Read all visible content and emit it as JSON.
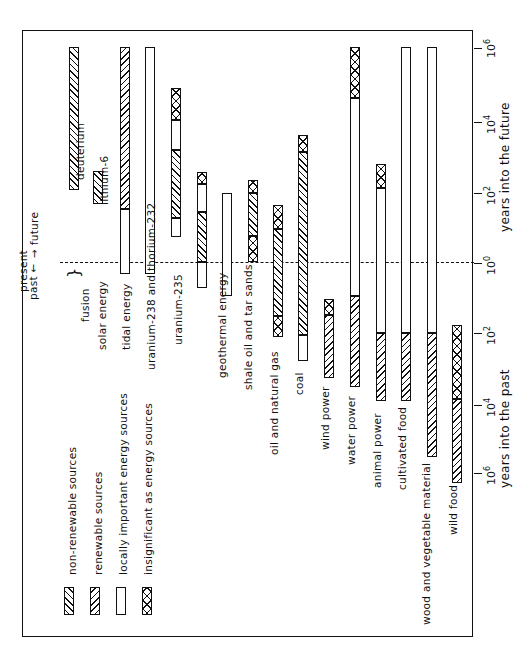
{
  "chart_data": {
    "type": "bar",
    "orientation": "rotated-90-ccw (time axis vertical, categories left-to-right)",
    "title": "",
    "axis": {
      "scale": "log10 years, signed (future positive, past negative)",
      "future_label": "years into the future",
      "past_label": "years into the past",
      "ticks": [
        {
          "value": 6,
          "label": "10",
          "exp": "6"
        },
        {
          "value": 4,
          "label": "10",
          "exp": "4"
        },
        {
          "value": 2,
          "label": "10",
          "exp": "2"
        },
        {
          "value": 0,
          "label": "10",
          "exp": "0"
        },
        {
          "value": -2,
          "label": "10",
          "exp": "2"
        },
        {
          "value": -4,
          "label": "10",
          "exp": "4"
        },
        {
          "value": -6,
          "label": "10",
          "exp": "6"
        }
      ],
      "range": [
        -6,
        6
      ]
    },
    "annotations": {
      "present": "present",
      "past": "past",
      "future": "future",
      "fusion": "fusion"
    },
    "legend": [
      {
        "key": "nonrenewable",
        "label": "non-renewable sources"
      },
      {
        "key": "renewable",
        "label": "renewable sources"
      },
      {
        "key": "local",
        "label": "locally important energy sources"
      },
      {
        "key": "insignificant",
        "label": "insignificant as energy sources"
      }
    ],
    "categories": [
      "deuterium",
      "lithium-6",
      "solar energy",
      "tidal energy",
      "uranium-238 and thorium-232",
      "uranium-235",
      "geothermal energy",
      "shale oil and tar sands",
      "oil and natural gas",
      "coal",
      "wind power",
      "water power",
      "animal power",
      "cultivated food",
      "wood and vegetable material",
      "wild food"
    ],
    "series": [
      {
        "name": "deuterium",
        "segments": [
          {
            "type": "nonrenewable",
            "from": 2.1,
            "to": 6
          }
        ]
      },
      {
        "name": "lithium-6",
        "segments": [
          {
            "type": "nonrenewable",
            "from": 1.6,
            "to": 2.6
          }
        ]
      },
      {
        "name": "solar energy",
        "segments": [
          {
            "type": "local",
            "from": -0.3,
            "to": 1.5
          },
          {
            "type": "renewable",
            "from": 1.5,
            "to": 6
          }
        ]
      },
      {
        "name": "tidal energy",
        "segments": [
          {
            "type": "local",
            "from": -0.3,
            "to": 6
          }
        ]
      },
      {
        "name": "uranium-238 and thorium-232",
        "segments": [
          {
            "type": "local",
            "from": 0.8,
            "to": 1.3
          },
          {
            "type": "nonrenewable",
            "from": 1.3,
            "to": 3.2
          },
          {
            "type": "local",
            "from": 3.2,
            "to": 4.1
          },
          {
            "type": "insignificant",
            "from": 4.1,
            "to": 5
          }
        ]
      },
      {
        "name": "uranium-235",
        "segments": [
          {
            "type": "local",
            "from": -0.7,
            "to": 0
          },
          {
            "type": "nonrenewable",
            "from": 0,
            "to": 1.4
          },
          {
            "type": "local",
            "from": 1.4,
            "to": 2.3
          },
          {
            "type": "insignificant",
            "from": 2.3,
            "to": 2.6
          }
        ]
      },
      {
        "name": "geothermal energy",
        "segments": [
          {
            "type": "local",
            "from": -0.9,
            "to": 2
          }
        ]
      },
      {
        "name": "shale oil and tar sands",
        "segments": [
          {
            "type": "insignificant",
            "from": 0,
            "to": 0.8
          },
          {
            "type": "nonrenewable",
            "from": 0.8,
            "to": 2
          },
          {
            "type": "insignificant",
            "from": 2,
            "to": 2.4
          }
        ]
      },
      {
        "name": "oil and natural gas",
        "segments": [
          {
            "type": "insignificant",
            "from": -2.1,
            "to": -1.5
          },
          {
            "type": "nonrenewable",
            "from": -1.5,
            "to": 1
          },
          {
            "type": "insignificant",
            "from": 1,
            "to": 1.6
          }
        ]
      },
      {
        "name": "coal",
        "segments": [
          {
            "type": "local",
            "from": -2.7,
            "to": -2
          },
          {
            "type": "nonrenewable",
            "from": -2,
            "to": 3.1
          },
          {
            "type": "insignificant",
            "from": 3.1,
            "to": 3.6
          }
        ]
      },
      {
        "name": "wind power",
        "segments": [
          {
            "type": "renewable",
            "from": -3.2,
            "to": -1.5
          },
          {
            "type": "insignificant",
            "from": -1.5,
            "to": -1
          }
        ]
      },
      {
        "name": "water power",
        "segments": [
          {
            "type": "renewable",
            "from": -3.5,
            "to": -0.9
          },
          {
            "type": "local",
            "from": -0.9,
            "to": 4.7
          },
          {
            "type": "insignificant",
            "from": 4.7,
            "to": 6
          }
        ]
      },
      {
        "name": "animal power",
        "segments": [
          {
            "type": "renewable",
            "from": -3.9,
            "to": -2
          },
          {
            "type": "local",
            "from": -2,
            "to": 2.1
          },
          {
            "type": "insignificant",
            "from": 2.1,
            "to": 2.8
          }
        ]
      },
      {
        "name": "cultivated food",
        "segments": [
          {
            "type": "renewable",
            "from": -3.9,
            "to": -2
          },
          {
            "type": "local",
            "from": -2,
            "to": 6
          }
        ]
      },
      {
        "name": "wood and vegetable material",
        "segments": [
          {
            "type": "renewable",
            "from": -5.4,
            "to": -2
          },
          {
            "type": "local",
            "from": -2,
            "to": 6
          }
        ]
      },
      {
        "name": "wild food",
        "segments": [
          {
            "type": "renewable",
            "from": -6.2,
            "to": -3.8
          },
          {
            "type": "insignificant",
            "from": -3.8,
            "to": -1.8
          }
        ]
      }
    ]
  },
  "layout": {
    "bars": [
      {
        "label": "deuterium",
        "x": 69,
        "lx": 82,
        "ly": 180,
        "segs": [
          {
            "t": "nonrenewable",
            "y1": 47,
            "y2": 190
          }
        ]
      },
      {
        "label": "lithium-6",
        "x": 93,
        "lx": 106,
        "ly": 205,
        "segs": [
          {
            "t": "nonrenewable",
            "y1": 171,
            "y2": 204
          }
        ]
      },
      {
        "label": "solar energy",
        "x": 120,
        "lx": 104,
        "ly": 350,
        "segs": [
          {
            "t": "renewable",
            "y1": 47,
            "y2": 209
          },
          {
            "t": "local",
            "y1": 209,
            "y2": 274
          }
        ]
      },
      {
        "label": "tidal energy",
        "x": 145,
        "lx": 128,
        "ly": 350,
        "segs": [
          {
            "t": "local",
            "y1": 47,
            "y2": 274
          }
        ]
      },
      {
        "label": "uranium-238 and thorium-232",
        "x": 171,
        "lx": 153,
        "ly": 370,
        "segs": [
          {
            "t": "insignificant",
            "y1": 88,
            "y2": 120
          },
          {
            "t": "local",
            "y1": 120,
            "y2": 150
          },
          {
            "t": "nonrenewable",
            "y1": 150,
            "y2": 218
          },
          {
            "t": "local",
            "y1": 218,
            "y2": 237
          }
        ]
      },
      {
        "label": "uranium-235",
        "x": 197,
        "lx": 180,
        "ly": 345,
        "segs": [
          {
            "t": "insignificant",
            "y1": 172,
            "y2": 184
          },
          {
            "t": "local",
            "y1": 184,
            "y2": 212
          },
          {
            "t": "nonrenewable",
            "y1": 212,
            "y2": 262
          },
          {
            "t": "local",
            "y1": 262,
            "y2": 288
          }
        ]
      },
      {
        "label": "geothermal energy",
        "x": 222,
        "lx": 224,
        "ly": 378,
        "segs": [
          {
            "t": "local",
            "y1": 193,
            "y2": 296
          }
        ]
      },
      {
        "label": "shale oil and tar sands",
        "x": 248,
        "lx": 250,
        "ly": 390,
        "segs": [
          {
            "t": "insignificant",
            "y1": 180,
            "y2": 193
          },
          {
            "t": "nonrenewable",
            "y1": 193,
            "y2": 236
          },
          {
            "t": "insignificant",
            "y1": 236,
            "y2": 262
          }
        ]
      },
      {
        "label": "oil and natural gas",
        "x": 273,
        "lx": 276,
        "ly": 455,
        "segs": [
          {
            "t": "insignificant",
            "y1": 205,
            "y2": 229
          },
          {
            "t": "nonrenewable",
            "y1": 229,
            "y2": 316
          },
          {
            "t": "insignificant",
            "y1": 316,
            "y2": 337
          }
        ]
      },
      {
        "label": "coal",
        "x": 298,
        "lx": 301,
        "ly": 395,
        "segs": [
          {
            "t": "insignificant",
            "y1": 135,
            "y2": 152
          },
          {
            "t": "nonrenewable",
            "y1": 152,
            "y2": 335
          },
          {
            "t": "local",
            "y1": 335,
            "y2": 361
          }
        ]
      },
      {
        "label": "wind power",
        "x": 324,
        "lx": 327,
        "ly": 450,
        "segs": [
          {
            "t": "insignificant",
            "y1": 299,
            "y2": 315
          },
          {
            "t": "renewable",
            "y1": 315,
            "y2": 378
          }
        ]
      },
      {
        "label": "water power",
        "x": 350,
        "lx": 353,
        "ly": 465,
        "segs": [
          {
            "t": "insignificant",
            "y1": 47,
            "y2": 98
          },
          {
            "t": "local",
            "y1": 98,
            "y2": 296
          },
          {
            "t": "renewable",
            "y1": 296,
            "y2": 387
          }
        ]
      },
      {
        "label": "animal power",
        "x": 376,
        "lx": 379,
        "ly": 488,
        "segs": [
          {
            "t": "insignificant",
            "y1": 164,
            "y2": 188
          },
          {
            "t": "local",
            "y1": 188,
            "y2": 333
          },
          {
            "t": "renewable",
            "y1": 333,
            "y2": 401
          }
        ]
      },
      {
        "label": "cultivated food",
        "x": 401,
        "lx": 404,
        "ly": 490,
        "segs": [
          {
            "t": "local",
            "y1": 47,
            "y2": 333
          },
          {
            "t": "renewable",
            "y1": 333,
            "y2": 401
          }
        ]
      },
      {
        "label": "wood and vegetable material",
        "x": 427,
        "lx": 428,
        "ly": 625,
        "segs": [
          {
            "t": "local",
            "y1": 47,
            "y2": 333
          },
          {
            "t": "renewable",
            "y1": 333,
            "y2": 457
          }
        ]
      },
      {
        "label": "wild food",
        "x": 452,
        "lx": 455,
        "ly": 535,
        "segs": [
          {
            "t": "insignificant",
            "y1": 325,
            "y2": 399
          },
          {
            "t": "renewable",
            "y1": 399,
            "y2": 483
          }
        ]
      }
    ]
  }
}
